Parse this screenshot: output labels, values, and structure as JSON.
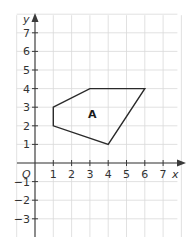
{
  "diagram": {
    "type": "coordinate-grid-polygon",
    "origin_label": "O",
    "x_axis": {
      "label": "x",
      "tick_labels": [
        "1",
        "2",
        "3",
        "4",
        "5",
        "6",
        "7"
      ],
      "range": [
        -1,
        8
      ]
    },
    "y_axis": {
      "label": "y",
      "tick_labels": [
        "7",
        "6",
        "5",
        "4",
        "3",
        "2",
        "1",
        "-1",
        "-2",
        "-3"
      ],
      "range": [
        -4,
        8
      ]
    },
    "shape": {
      "label": "A",
      "vertices": [
        [
          1,
          3
        ],
        [
          3,
          4
        ],
        [
          6,
          4
        ],
        [
          4,
          1
        ],
        [
          1,
          2
        ]
      ],
      "stroke_color": "#2a2a2a"
    },
    "grid_color": "#d9d9d9",
    "axis_color": "#3a3a3a"
  }
}
